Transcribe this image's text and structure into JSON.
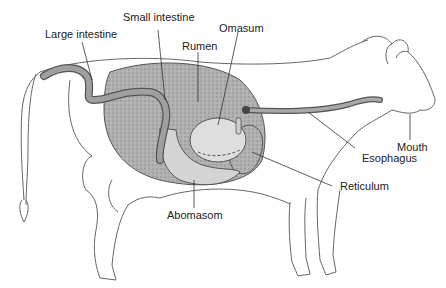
{
  "diagram": {
    "labels": {
      "large_intestine": "Large intestine",
      "small_intestine": "Small intestine",
      "rumen": "Rumen",
      "omasum": "Omasum",
      "mouth": "Mouth",
      "esophagus": "Esophagus",
      "reticulum": "Reticulum",
      "abomasom": "Abomasom"
    },
    "colors": {
      "outline": "#555555",
      "rumen_fill": "#a8a8a8",
      "organ_fill": "#d6d6d6",
      "intestine_fill": "#9a9a9a",
      "text": "#222222"
    }
  }
}
